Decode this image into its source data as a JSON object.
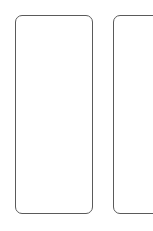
{
  "canvas": {
    "width": 153,
    "height": 231,
    "background_color": "#ffffff"
  },
  "style": {
    "card_border_color": "#5a5a5a",
    "card_fill_color": "#ffffff",
    "card_border_width": 1,
    "card_corner_radius": 7
  },
  "cards": [
    {
      "name": "card-left",
      "label": "",
      "content": "",
      "x": 15,
      "y": 15,
      "width": 78,
      "height": 199,
      "clipped": false
    },
    {
      "name": "card-right",
      "label": "",
      "content": "",
      "x": 113,
      "y": 15,
      "width": 78,
      "height": 199,
      "clipped": true
    }
  ]
}
